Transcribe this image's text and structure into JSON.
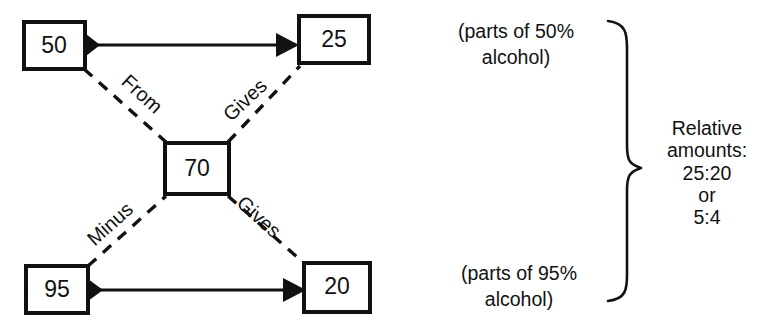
{
  "diagram": {
    "nodes": {
      "top_left": "50",
      "top_right": "25",
      "center": "70",
      "bottom_left": "95",
      "bottom_right": "20"
    },
    "link_labels": {
      "from": "From",
      "gives_upper": "Gives",
      "minus": "Minus",
      "gives_lower": "Gives"
    }
  },
  "captions": {
    "top": {
      "line1": "(parts of 50%",
      "line2": "alcohol)"
    },
    "bottom": {
      "line1": "(parts of 95%",
      "line2": "alcohol)"
    }
  },
  "summary": {
    "line1": "Relative",
    "line2": "amounts:",
    "line3": "25:20",
    "line4": "or",
    "line5": "5:4"
  },
  "colors": {
    "ink": "#111111",
    "paper": "#ffffff"
  }
}
